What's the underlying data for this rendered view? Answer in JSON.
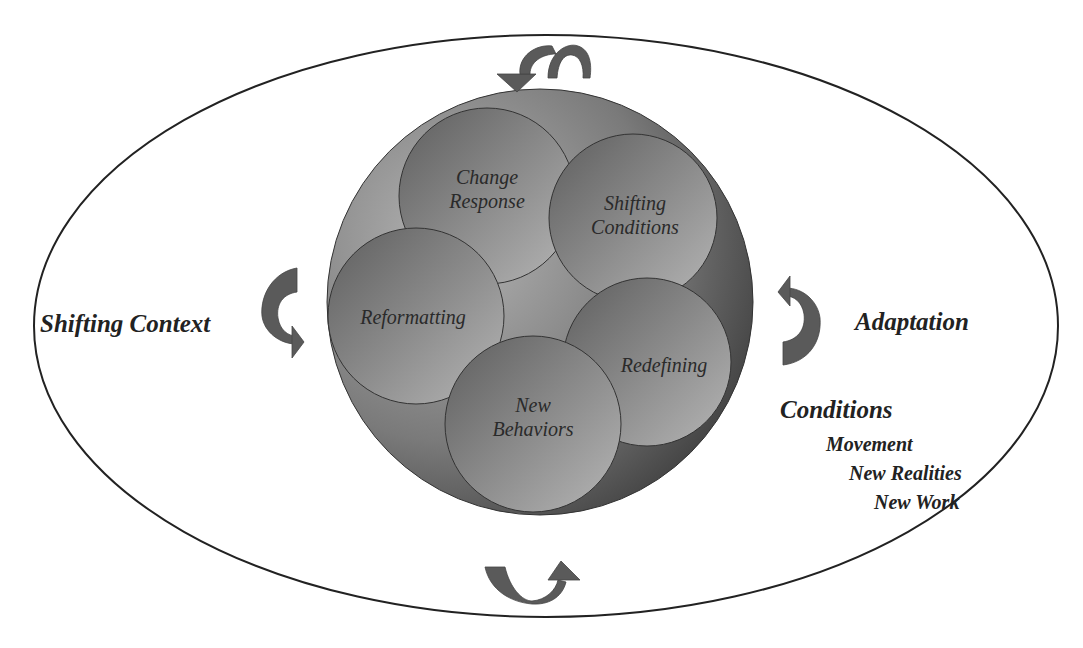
{
  "diagram": {
    "outer_ellipse": {
      "cx": 546,
      "cy": 326,
      "rx": 512,
      "ry": 291,
      "stroke": "#222222"
    },
    "core_circle": {
      "cx": 540,
      "cy": 302,
      "r": 213,
      "fill": "#6e6e6e"
    },
    "bubbles": [
      {
        "id": "change-response",
        "lines": [
          "Change",
          "Response"
        ],
        "cx": 487,
        "cy": 196,
        "r": 88
      },
      {
        "id": "shifting-conditions",
        "lines": [
          "Shifting",
          "Conditions"
        ],
        "cx": 633,
        "cy": 218,
        "r": 84
      },
      {
        "id": "reformatting",
        "lines": [
          "Reformatting"
        ],
        "cx": 416,
        "cy": 316,
        "r": 88
      },
      {
        "id": "redefining",
        "lines": [
          "Redefining"
        ],
        "cx": 647,
        "cy": 362,
        "r": 84
      },
      {
        "id": "new-behaviors",
        "lines": [
          "New",
          "Behaviors"
        ],
        "cx": 533,
        "cy": 424,
        "r": 88
      }
    ],
    "labels": {
      "left": "Shifting Context",
      "right": "Adaptation",
      "conditions_heading": "Conditions",
      "conditions_items": [
        "Movement",
        "New Realities",
        "New Work"
      ]
    },
    "colors": {
      "arrow": "#5a5a5a",
      "bubble_light": "#a8a8a8",
      "bubble_dark": "#5c5c5c",
      "outline": "#222222",
      "text": "#222222"
    },
    "arrows": [
      "top-cycle-arrow",
      "bottom-cycle-arrow",
      "left-cycle-arrow",
      "right-cycle-arrow"
    ]
  }
}
